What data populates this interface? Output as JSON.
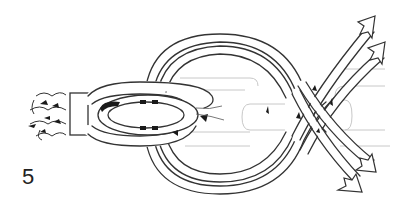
{
  "figure": {
    "step_number": "5",
    "colors": {
      "background": "#ffffff",
      "line": "#333333",
      "ghost_line": "#c8c8c8",
      "shading": "#1a1a1a"
    },
    "elements": {
      "braided_rope_end": "braided-rope-end",
      "whipping_band": "whipping-band",
      "eye_loop": "eye-loop",
      "outer_loops": "outer-rope-loops",
      "crossing": "rope-crossing",
      "arrows_up": 2,
      "arrows_down": 2
    }
  }
}
